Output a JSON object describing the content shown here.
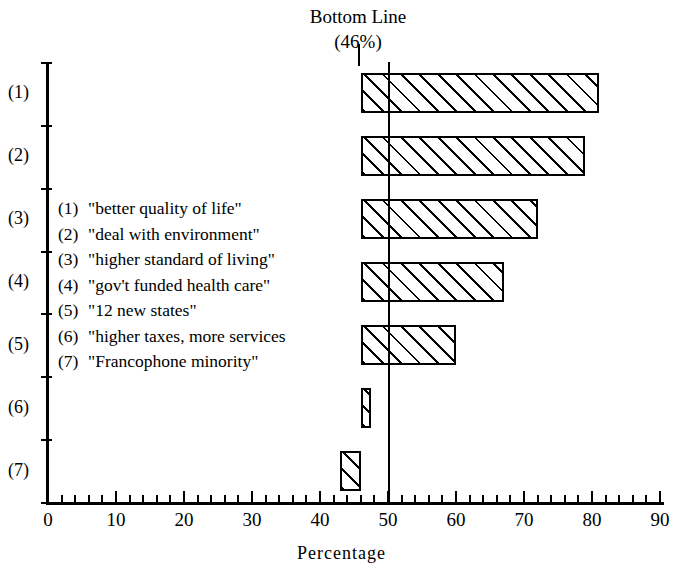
{
  "chart_data": {
    "type": "bar",
    "orientation": "horizontal",
    "title": "Bottom Line",
    "subtitle": "(46%)",
    "xlabel": "Percentage",
    "ylabel": "",
    "xlim": [
      0,
      90
    ],
    "xticks": [
      0,
      10,
      20,
      30,
      40,
      50,
      60,
      70,
      80,
      90
    ],
    "xtick_labels": [
      "0",
      "10",
      "20",
      "30",
      "40",
      "50",
      "60",
      "70",
      "80",
      "90"
    ],
    "minor_tick_step": 2,
    "grid": false,
    "legend_position": "inside-left",
    "baseline": 46,
    "reference_line": 50,
    "categories": [
      "(1)",
      "(2)",
      "(3)",
      "(4)",
      "(5)",
      "(6)",
      "(7)"
    ],
    "values": [
      81,
      79,
      72,
      67,
      60,
      47.5,
      43
    ],
    "bar_spans": [
      {
        "category": "(1)",
        "start": 46,
        "end": 81
      },
      {
        "category": "(2)",
        "start": 46,
        "end": 79
      },
      {
        "category": "(3)",
        "start": 46,
        "end": 72
      },
      {
        "category": "(4)",
        "start": 46,
        "end": 67
      },
      {
        "category": "(5)",
        "start": 46,
        "end": 60
      },
      {
        "category": "(6)",
        "start": 46,
        "end": 47.5
      },
      {
        "category": "(7)",
        "start": 43,
        "end": 46
      }
    ],
    "fill_pattern": "diagonal-hatch",
    "annotations": [
      "Bottom Line (46%)"
    ]
  },
  "title": {
    "line1": "Bottom Line",
    "line2": "(46%)"
  },
  "axis": {
    "x_title": "Percentage",
    "x_labels": [
      "0",
      "10",
      "20",
      "30",
      "40",
      "50",
      "60",
      "70",
      "80",
      "90"
    ],
    "y_labels": [
      "(1)",
      "(2)",
      "(3)",
      "(4)",
      "(5)",
      "(6)",
      "(7)"
    ]
  },
  "legend": {
    "items": [
      {
        "key": "(1)",
        "text": "\"better quality of life\""
      },
      {
        "key": "(2)",
        "text": "\"deal with environment\""
      },
      {
        "key": "(3)",
        "text": "\"higher standard of living\""
      },
      {
        "key": "(4)",
        "text": "\"gov't funded health care\""
      },
      {
        "key": "(5)",
        "text": "\"12 new states\""
      },
      {
        "key": "(6)",
        "text": "\"higher taxes, more services"
      },
      {
        "key": "(7)",
        "text": "\"Francophone minority\""
      }
    ]
  },
  "colors": {
    "ink": "#000000",
    "paper": "#ffffff"
  }
}
